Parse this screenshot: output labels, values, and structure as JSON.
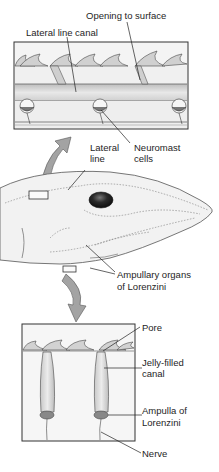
{
  "figure": {
    "top_panel": {
      "labels": {
        "opening": "Opening to surface",
        "canal": "Lateral line canal",
        "neuromast": [
          "Neuromast",
          "cells"
        ]
      }
    },
    "middle_panel": {
      "labels": {
        "lateral_line": [
          "Lateral",
          "line"
        ],
        "ampullary": [
          "Ampullary organs",
          "of Lorenzini"
        ]
      }
    },
    "bottom_panel": {
      "labels": {
        "pore": "Pore",
        "jelly": [
          "Jelly-filled",
          "canal"
        ],
        "ampulla": [
          "Ampulla of",
          "Lorenzini"
        ],
        "nerve": "Nerve"
      }
    },
    "colors": {
      "outline": "#333333",
      "skin": "#efefef",
      "canal_fill": "#d9d9d9",
      "eye": "#222222",
      "arrow": "#9a9a9a"
    }
  }
}
